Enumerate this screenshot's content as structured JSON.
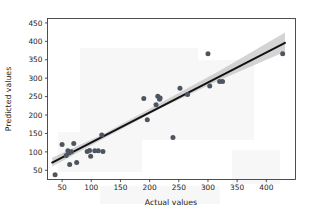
{
  "figure": {
    "background_color": "#ffffff",
    "frame_color": "#3c3c3c",
    "marker_color": "#4d5560",
    "line_color": "#111111",
    "band_color": "#b9b9b9"
  },
  "chart_data": {
    "type": "scatter",
    "title": "",
    "xlabel": "Actual values",
    "ylabel": "Predicted values",
    "xlim": [
      25,
      450
    ],
    "ylim": [
      25,
      462
    ],
    "xticks": [
      50,
      100,
      150,
      200,
      250,
      300,
      350,
      400
    ],
    "xtick_labels": [
      "50",
      "100",
      "150",
      "200",
      "250",
      "300",
      "350",
      "400"
    ],
    "yticks": [
      50,
      100,
      150,
      200,
      250,
      300,
      350,
      400,
      450
    ],
    "ytick_labels": [
      "50",
      "100",
      "150",
      "200",
      "250",
      "300",
      "350",
      "400",
      "450"
    ],
    "grid": false,
    "legend": null,
    "points": [
      {
        "x": 38,
        "y": 38
      },
      {
        "x": 50,
        "y": 120
      },
      {
        "x": 57,
        "y": 90
      },
      {
        "x": 60,
        "y": 103
      },
      {
        "x": 62,
        "y": 97
      },
      {
        "x": 63,
        "y": 66
      },
      {
        "x": 66,
        "y": 100
      },
      {
        "x": 70,
        "y": 123
      },
      {
        "x": 75,
        "y": 71
      },
      {
        "x": 93,
        "y": 101
      },
      {
        "x": 97,
        "y": 104
      },
      {
        "x": 99,
        "y": 88
      },
      {
        "x": 106,
        "y": 103
      },
      {
        "x": 112,
        "y": 103
      },
      {
        "x": 118,
        "y": 146
      },
      {
        "x": 120,
        "y": 101
      },
      {
        "x": 190,
        "y": 245
      },
      {
        "x": 196,
        "y": 187
      },
      {
        "x": 211,
        "y": 228
      },
      {
        "x": 214,
        "y": 251
      },
      {
        "x": 217,
        "y": 243
      },
      {
        "x": 218,
        "y": 246
      },
      {
        "x": 240,
        "y": 139
      },
      {
        "x": 252,
        "y": 273
      },
      {
        "x": 265,
        "y": 256
      },
      {
        "x": 300,
        "y": 366
      },
      {
        "x": 303,
        "y": 279
      },
      {
        "x": 320,
        "y": 291
      },
      {
        "x": 325,
        "y": 291
      },
      {
        "x": 428,
        "y": 366
      }
    ],
    "regression_line": {
      "x_start": 33,
      "y_start": 71,
      "x_end": 432,
      "y_end": 396
    },
    "confidence_band": {
      "upper": [
        {
          "x": 33,
          "y": 84
        },
        {
          "x": 120,
          "y": 148
        },
        {
          "x": 220,
          "y": 234
        },
        {
          "x": 320,
          "y": 320
        },
        {
          "x": 432,
          "y": 424
        }
      ],
      "lower": [
        {
          "x": 33,
          "y": 60
        },
        {
          "x": 120,
          "y": 135
        },
        {
          "x": 220,
          "y": 219
        },
        {
          "x": 320,
          "y": 295
        },
        {
          "x": 432,
          "y": 372
        }
      ]
    }
  }
}
